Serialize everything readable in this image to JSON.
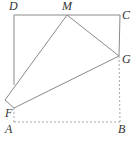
{
  "diagram": {
    "type": "geometry-fold",
    "colors": {
      "solid_line": "#8a8a8a",
      "dashed_line": "#a8a8a8",
      "label": "#333333"
    },
    "points": {
      "D": {
        "label": "D",
        "x": 14,
        "y": 15
      },
      "M": {
        "label": "M",
        "x": 67,
        "y": 15
      },
      "C": {
        "label": "C",
        "x": 120,
        "y": 15
      },
      "G": {
        "label": "G",
        "x": 119,
        "y": 56
      },
      "F": {
        "label": "F",
        "x": 14,
        "y": 108
      },
      "A": {
        "label": "A",
        "x": 14,
        "y": 122
      },
      "B": {
        "label": "B",
        "x": 120,
        "y": 122
      },
      "A_prime": {
        "label": "",
        "x": 5,
        "y": 100
      },
      "E": {
        "label": "",
        "x": 14,
        "y": 85
      }
    },
    "labels": [
      {
        "text": "D",
        "x": 9,
        "y": 10
      },
      {
        "text": "M",
        "x": 62,
        "y": 10
      },
      {
        "text": "C",
        "x": 122,
        "y": 19
      },
      {
        "text": "G",
        "x": 122,
        "y": 63
      },
      {
        "text": "F",
        "x": 5,
        "y": 117
      },
      {
        "text": "A",
        "x": 5,
        "y": 133
      },
      {
        "text": "B",
        "x": 118,
        "y": 133
      }
    ],
    "solid_segments": [
      [
        "D",
        "C"
      ],
      [
        "C",
        "G"
      ],
      [
        "D",
        "E"
      ],
      [
        "M",
        "G"
      ],
      [
        "M",
        "A_prime"
      ],
      [
        "A_prime",
        "F"
      ],
      [
        "F",
        "G"
      ]
    ],
    "dashed_segments": [
      [
        "F",
        "A"
      ],
      [
        "A",
        "B"
      ],
      [
        "B",
        "G"
      ]
    ]
  }
}
